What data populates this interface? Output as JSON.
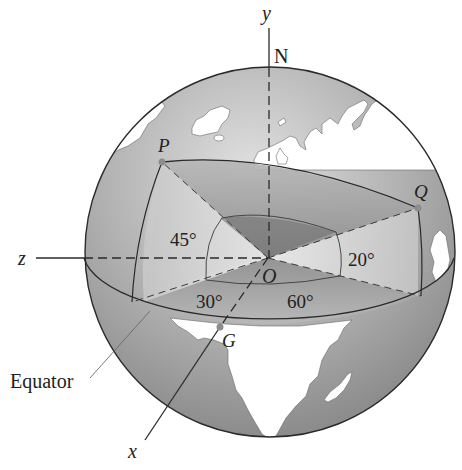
{
  "figure": {
    "type": "spherical-coordinates-globe",
    "axes": {
      "x": "x",
      "y": "y",
      "z": "z"
    },
    "points": {
      "north_pole": "N",
      "origin": "O",
      "P": "P",
      "Q": "Q",
      "G": "G"
    },
    "angles": {
      "p_latitude": "45°",
      "q_latitude": "20°",
      "p_longitude": "30°",
      "q_longitude": "60°"
    },
    "callouts": {
      "equator": "Equator"
    },
    "colors": {
      "sphere_light": "#d9d9d9",
      "sphere_dark": "#8a8a8a",
      "land": "#ffffff",
      "outline": "#2a2a2a",
      "point": "#8c8c8c"
    }
  }
}
